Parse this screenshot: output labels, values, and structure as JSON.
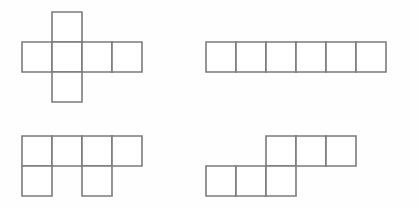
{
  "figure": {
    "background_color": "#fefefe",
    "stroke_color": "#7b7b7b",
    "fill_color": "#ffffff",
    "stroke_width": 1.6,
    "cell_size": 30,
    "canvas": {
      "width": 419,
      "height": 208
    }
  },
  "shapes": [
    {
      "id": "shape-top-left",
      "name": "plus-cross-net",
      "label": "",
      "origin": {
        "x": 22,
        "y": 12
      },
      "cell_size": 30,
      "grid_cols": 4,
      "grid_rows": 3,
      "cells": [
        {
          "col": 1,
          "row": 0
        },
        {
          "col": 0,
          "row": 1
        },
        {
          "col": 1,
          "row": 1
        },
        {
          "col": 2,
          "row": 1
        },
        {
          "col": 3,
          "row": 1
        },
        {
          "col": 1,
          "row": 2
        }
      ],
      "square_count": 6
    },
    {
      "id": "shape-top-right",
      "name": "straight-strip-net",
      "label": "",
      "origin": {
        "x": 206,
        "y": 42
      },
      "cell_size": 30,
      "grid_cols": 6,
      "grid_rows": 1,
      "cells": [
        {
          "col": 0,
          "row": 0
        },
        {
          "col": 1,
          "row": 0
        },
        {
          "col": 2,
          "row": 0
        },
        {
          "col": 3,
          "row": 0
        },
        {
          "col": 4,
          "row": 0
        },
        {
          "col": 5,
          "row": 0
        }
      ],
      "square_count": 6
    },
    {
      "id": "shape-bottom-left",
      "name": "four-over-two-net",
      "label": "",
      "origin": {
        "x": 22,
        "y": 136
      },
      "cell_size": 30,
      "grid_cols": 4,
      "grid_rows": 2,
      "cells": [
        {
          "col": 0,
          "row": 0
        },
        {
          "col": 1,
          "row": 0
        },
        {
          "col": 2,
          "row": 0
        },
        {
          "col": 3,
          "row": 0
        },
        {
          "col": 0,
          "row": 1
        },
        {
          "col": 2,
          "row": 1
        }
      ],
      "square_count": 6
    },
    {
      "id": "shape-bottom-right",
      "name": "offset-stairs-net",
      "label": "",
      "origin": {
        "x": 206,
        "y": 136
      },
      "cell_size": 30,
      "grid_cols": 5,
      "grid_rows": 2,
      "cells": [
        {
          "col": 2,
          "row": 0
        },
        {
          "col": 3,
          "row": 0
        },
        {
          "col": 4,
          "row": 0
        },
        {
          "col": 0,
          "row": 1
        },
        {
          "col": 1,
          "row": 1
        },
        {
          "col": 2,
          "row": 1
        }
      ],
      "square_count": 6
    }
  ]
}
